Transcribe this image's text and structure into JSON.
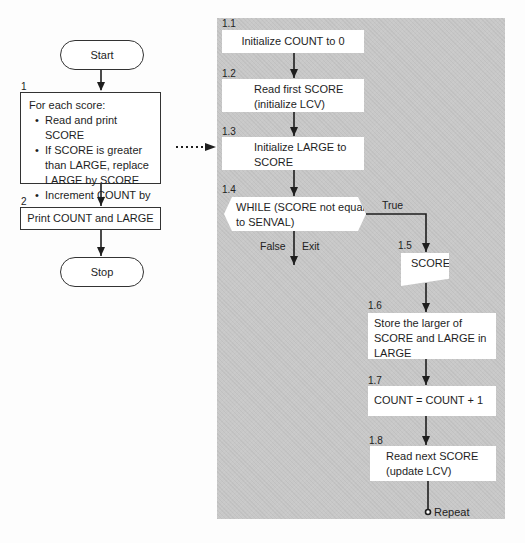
{
  "left_flow": {
    "start_label": "Start",
    "step1": {
      "number": "1",
      "heading": "For each score:",
      "bullets": [
        "Read and print SCORE",
        "If SCORE is greater than LARGE, replace LARGE by SCORE",
        "Increment COUNT by one"
      ]
    },
    "step2": {
      "number": "2",
      "text": "Print COUNT and LARGE"
    },
    "stop_label": "Stop"
  },
  "refinement": {
    "steps": [
      {
        "number": "1.1",
        "text": "Initialize COUNT to 0"
      },
      {
        "number": "1.2",
        "text_line1": "Read first SCORE",
        "text_line2": "(initialize LCV)"
      },
      {
        "number": "1.3",
        "text_line1": "Initialize LARGE to",
        "text_line2": "SCORE"
      },
      {
        "number": "1.4",
        "text_line1": "WHILE (SCORE not equal",
        "text_line2": "to SENVAL)"
      },
      {
        "number": "1.5",
        "text": "SCORE"
      },
      {
        "number": "1.6",
        "text_line1": "Store the larger of",
        "text_line2": "SCORE and LARGE in",
        "text_line3": "LARGE"
      },
      {
        "number": "1.7",
        "text": "COUNT = COUNT + 1"
      },
      {
        "number": "1.8",
        "text_line1": "Read next SCORE",
        "text_line2": "(update LCV)"
      }
    ],
    "branch_true": "True",
    "branch_false": "False",
    "branch_exit": "Exit",
    "repeat_label": "Repeat"
  },
  "colors": {
    "panel": "#c8c8c8",
    "box": "#ffffff",
    "line": "#1e1e1e"
  }
}
